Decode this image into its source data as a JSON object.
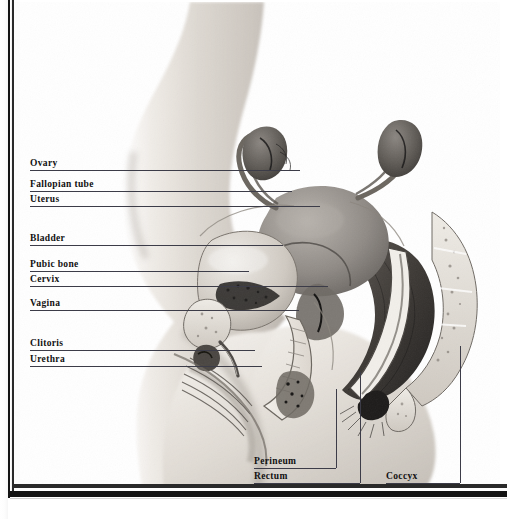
{
  "figure": {
    "view": "lateral cut-away of the female pelvis showing reproductive and urinary organs",
    "style": "grayscale airbrush medical illustration on a scanned book page",
    "background_color": "#ffffff",
    "ink_color": "#111111",
    "leader_color": "#3c3c48",
    "skin_tone": "#d9d4cd",
    "organ_tone": "#9a958f"
  },
  "labels": {
    "left": [
      {
        "id": "ovary",
        "text": "Ovary",
        "x": 30,
        "y": 158,
        "line_y": 170,
        "line_x1": 30,
        "line_x2": 300
      },
      {
        "id": "fallopian",
        "text": "Fallopian tube",
        "x": 30,
        "y": 179,
        "line_y": 191,
        "line_x1": 30,
        "line_x2": 292
      },
      {
        "id": "uterus",
        "text": "Uterus",
        "x": 30,
        "y": 194,
        "line_y": 206,
        "line_x1": 30,
        "line_x2": 320
      },
      {
        "id": "bladder",
        "text": "Bladder",
        "x": 30,
        "y": 233,
        "line_y": 245,
        "line_x1": 30,
        "line_x2": 283
      },
      {
        "id": "pubic-bone",
        "text": "Pubic bone",
        "x": 30,
        "y": 259,
        "line_y": 271,
        "line_x1": 30,
        "line_x2": 249
      },
      {
        "id": "cervix",
        "text": "Cervix",
        "x": 30,
        "y": 274,
        "line_y": 286,
        "line_x1": 30,
        "line_x2": 328
      },
      {
        "id": "vagina",
        "text": "Vagina",
        "x": 30,
        "y": 298,
        "line_y": 310,
        "line_x1": 30,
        "line_x2": 299
      },
      {
        "id": "clitoris",
        "text": "Clitoris",
        "x": 30,
        "y": 338,
        "line_y": 350,
        "line_x1": 30,
        "line_x2": 255
      },
      {
        "id": "urethra",
        "text": "Urethra",
        "x": 30,
        "y": 354,
        "line_y": 366,
        "line_x1": 30,
        "line_x2": 262
      }
    ],
    "bottom": [
      {
        "id": "perineum",
        "text": "Perineum",
        "x": 254,
        "y": 456,
        "line_y": 468,
        "line_x1": 254,
        "line_x2": 336,
        "riser_x": 336,
        "riser_y1": 389,
        "riser_y2": 468
      },
      {
        "id": "rectum",
        "text": "Rectum",
        "x": 254,
        "y": 471,
        "line_y": 483,
        "line_x1": 254,
        "line_x2": 360,
        "riser_x": 360,
        "riser_y1": 372,
        "riser_y2": 483
      },
      {
        "id": "coccyx",
        "text": "Coccyx",
        "x": 386,
        "y": 471,
        "line_y": 483,
        "line_x1": 386,
        "line_x2": 460,
        "riser_x": 460,
        "riser_y1": 346,
        "riser_y2": 483
      }
    ]
  }
}
